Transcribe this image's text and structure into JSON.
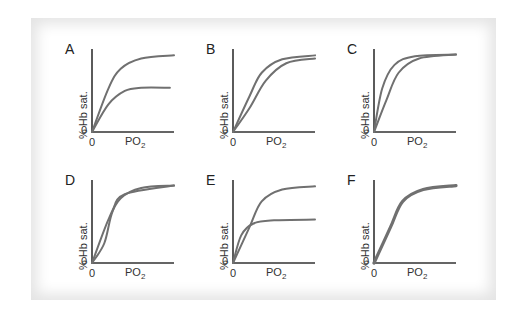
{
  "figure": {
    "colors": {
      "curve": "#707070",
      "axis": "#333333",
      "frame_shadow": "#e4e4e4"
    },
    "axis_labels": {
      "y": "% Hb sat.",
      "x_main": "PO",
      "x_sub": "2",
      "origin": "0"
    },
    "panels": [
      {
        "label": "A"
      },
      {
        "label": "B"
      },
      {
        "label": "C"
      },
      {
        "label": "D"
      },
      {
        "label": "E"
      },
      {
        "label": "F"
      }
    ]
  },
  "chart_data": [
    {
      "type": "line",
      "title": "A",
      "xlabel": "PO2",
      "ylabel": "% Hb sat.",
      "series": [
        {
          "name": "curve 1",
          "shape": "hyperbolic, high plateau",
          "points": [
            [
              0,
              0
            ],
            [
              0.2,
              0.55
            ],
            [
              0.35,
              0.8
            ],
            [
              0.6,
              0.93
            ],
            [
              1,
              0.97
            ]
          ]
        },
        {
          "name": "curve 2",
          "shape": "hyperbolic, low plateau (~60%)",
          "points": [
            [
              0,
              0
            ],
            [
              0.2,
              0.35
            ],
            [
              0.4,
              0.52
            ],
            [
              0.6,
              0.56
            ],
            [
              0.95,
              0.56
            ]
          ]
        }
      ]
    },
    {
      "type": "line",
      "title": "B",
      "xlabel": "PO2",
      "ylabel": "% Hb sat.",
      "series": [
        {
          "name": "curve 1",
          "shape": "sigmoid, left",
          "points": [
            [
              0,
              0
            ],
            [
              0.2,
              0.45
            ],
            [
              0.35,
              0.75
            ],
            [
              0.6,
              0.92
            ],
            [
              1,
              0.97
            ]
          ]
        },
        {
          "name": "curve 2",
          "shape": "sigmoid, right-shifted",
          "points": [
            [
              0,
              0
            ],
            [
              0.2,
              0.3
            ],
            [
              0.4,
              0.65
            ],
            [
              0.65,
              0.87
            ],
            [
              1,
              0.93
            ]
          ]
        }
      ]
    },
    {
      "type": "line",
      "title": "C",
      "xlabel": "PO2",
      "ylabel": "% Hb sat.",
      "series": [
        {
          "name": "curve 1",
          "shape": "steep hyperbolic",
          "points": [
            [
              0,
              0
            ],
            [
              0.1,
              0.55
            ],
            [
              0.25,
              0.85
            ],
            [
              0.5,
              0.96
            ],
            [
              1,
              0.98
            ]
          ]
        },
        {
          "name": "curve 2",
          "shape": "sigmoid",
          "points": [
            [
              0,
              0
            ],
            [
              0.15,
              0.4
            ],
            [
              0.3,
              0.75
            ],
            [
              0.55,
              0.93
            ],
            [
              1,
              0.98
            ]
          ]
        }
      ]
    },
    {
      "type": "line",
      "title": "D",
      "xlabel": "PO2",
      "ylabel": "% Hb sat.",
      "series": [
        {
          "name": "curve 1",
          "shape": "hyperbolic",
          "points": [
            [
              0,
              0
            ],
            [
              0.2,
              0.55
            ],
            [
              0.35,
              0.82
            ],
            [
              0.6,
              0.95
            ],
            [
              1,
              0.98
            ]
          ]
        },
        {
          "name": "curve 2",
          "shape": "steep sigmoid, crossing",
          "points": [
            [
              0,
              0
            ],
            [
              0.15,
              0.25
            ],
            [
              0.25,
              0.65
            ],
            [
              0.4,
              0.87
            ],
            [
              1,
              0.98
            ]
          ]
        }
      ]
    },
    {
      "type": "line",
      "title": "E",
      "xlabel": "PO2",
      "ylabel": "% Hb sat.",
      "series": [
        {
          "name": "curve 1",
          "shape": "sigmoid, high plateau",
          "points": [
            [
              0,
              0
            ],
            [
              0.2,
              0.45
            ],
            [
              0.35,
              0.78
            ],
            [
              0.6,
              0.93
            ],
            [
              1,
              0.97
            ]
          ]
        },
        {
          "name": "curve 2",
          "shape": "hyperbolic, low plateau (~55%)",
          "points": [
            [
              0,
              0
            ],
            [
              0.1,
              0.35
            ],
            [
              0.25,
              0.5
            ],
            [
              0.5,
              0.54
            ],
            [
              1,
              0.55
            ]
          ]
        }
      ]
    },
    {
      "type": "line",
      "title": "F",
      "xlabel": "PO2",
      "ylabel": "% Hb sat.",
      "series": [
        {
          "name": "curves (overlapping)",
          "shape": "sigmoid, two identical curves",
          "points": [
            [
              0,
              0
            ],
            [
              0.2,
              0.45
            ],
            [
              0.35,
              0.78
            ],
            [
              0.6,
              0.93
            ],
            [
              1,
              0.98
            ]
          ]
        }
      ]
    }
  ]
}
